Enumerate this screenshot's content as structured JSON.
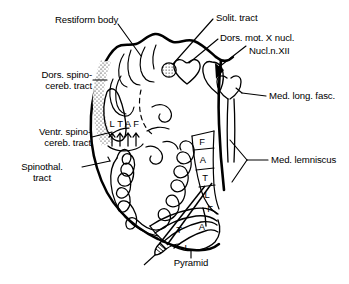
{
  "figure": {
    "title_note": "Cross-section of the medulla oblongata at the level of the inferior olive",
    "background_color": "#ffffff",
    "line_color": "#000000"
  },
  "labels": {
    "restiform_body": "Restiform body",
    "solit_tract": "Solit. tract",
    "dors_mot_x_nucl": "Dors. mot. X nucl.",
    "nucl_n_xii": "Nucl.n.XII",
    "med_long_fasc": "Med. long. fasc.",
    "med_lemniscus": "Med. lemniscus",
    "dors_spinocereb_l1": "Dors. spino-",
    "dors_spinocereb_l2": "cereb. tract",
    "ventr_spinocereb_l1": "Ventr. spino-",
    "ventr_spinocereb_l2": "cereb. tract",
    "spinothal_l1": "Spinothal.",
    "spinothal_l2": "tract",
    "pyramid": "Pyramid"
  },
  "lamination": {
    "spinothalamic": {
      "note": "Somatotopic lamination letters above arrows on the spinothalamic tract",
      "letters": [
        "L",
        "T",
        "A",
        "F"
      ]
    },
    "medial_lemniscus": {
      "note": "Somatotopic lamination within the medial lemniscus, dorsal to ventral",
      "letters": [
        "F",
        "A",
        "T",
        "L"
      ]
    },
    "pyramid": {
      "note": "Somatotopic lamination within the pyramid",
      "letters": [
        "F",
        "A",
        "T",
        "L"
      ]
    }
  }
}
